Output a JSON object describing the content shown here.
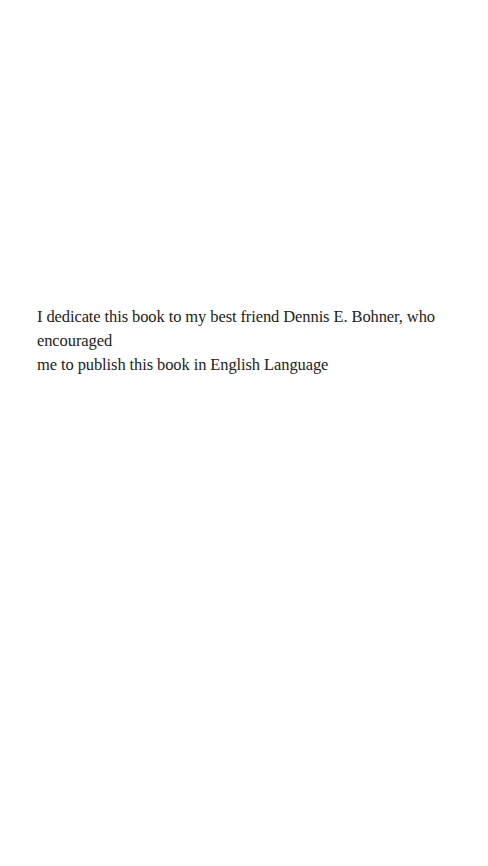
{
  "page": {
    "dedication": {
      "line1": "I dedicate this book to my best friend Dennis E. Bohner, who encouraged",
      "line2": "me to publish this book in English Language"
    }
  }
}
